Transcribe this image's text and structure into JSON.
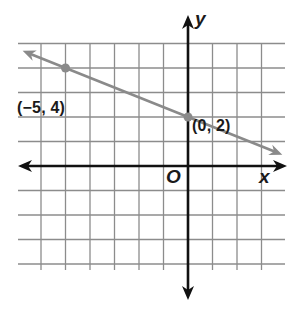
{
  "chart_data": {
    "type": "line",
    "title": "",
    "xlabel": "x",
    "ylabel": "y",
    "origin_label": "O",
    "grid": true,
    "xlim": [
      -7,
      4
    ],
    "ylim": [
      -5,
      6
    ],
    "gridline_x": [
      -6,
      -5,
      -4,
      -3,
      -2,
      -1,
      1,
      2,
      3
    ],
    "gridline_y": [
      -4,
      -3,
      -2,
      -1,
      1,
      2,
      3,
      4,
      5
    ],
    "series": [
      {
        "name": "line",
        "slope": -0.4,
        "intercept": 2,
        "points": [
          {
            "x": -5,
            "y": 4,
            "label": "(−5, 4)"
          },
          {
            "x": 0,
            "y": 2,
            "label": "(0, 2)"
          }
        ],
        "color": "#8a8a8a",
        "arrows": "both"
      }
    ]
  },
  "colors": {
    "grid": "#8c8c8c",
    "axes": "#111111",
    "line": "#8a8a8a",
    "point": "#8a8a8a",
    "text": "#1a1a1a"
  }
}
